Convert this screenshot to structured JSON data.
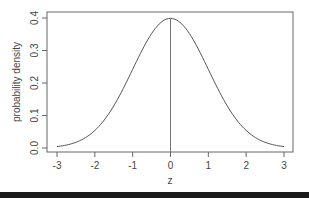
{
  "chart_data": {
    "type": "line",
    "title": "",
    "xlabel": "z",
    "ylabel": "probability density",
    "xlim": [
      -3,
      3
    ],
    "ylim": [
      0,
      0.4
    ],
    "xticks": [
      "-3",
      "-2",
      "-1",
      "0",
      "1",
      "2",
      "3"
    ],
    "yticks": [
      "0.0",
      "0.1",
      "0.2",
      "0.3",
      "0.4"
    ],
    "grid": false,
    "legend": null,
    "series": [
      {
        "name": "standard normal density",
        "x": [
          -3,
          -2.5,
          -2,
          -1.5,
          -1,
          -0.5,
          0,
          0.5,
          1,
          1.5,
          2,
          2.5,
          3
        ],
        "y": [
          0.0044,
          0.0175,
          0.054,
          0.1295,
          0.242,
          0.3521,
          0.3989,
          0.3521,
          0.242,
          0.1295,
          0.054,
          0.0175,
          0.0044
        ]
      }
    ],
    "annotations": [
      {
        "type": "vertical-line",
        "x": 0,
        "from_y": 0,
        "to_y": 0.3989
      }
    ]
  }
}
